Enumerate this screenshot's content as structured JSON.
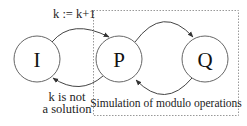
{
  "diagram": {
    "type": "state-diagram",
    "nodes": [
      {
        "id": "I",
        "label": "I",
        "cx": 37,
        "cy": 59,
        "r": 23
      },
      {
        "id": "P",
        "label": "P",
        "cx": 119,
        "cy": 59,
        "r": 23
      },
      {
        "id": "Q",
        "label": "Q",
        "cx": 205,
        "cy": 59,
        "r": 23
      }
    ],
    "edges": [
      {
        "from": "I",
        "to": "P",
        "label": "k := k+1"
      },
      {
        "from": "P",
        "to": "I",
        "label_lines": [
          "k is not",
          "a solution"
        ]
      },
      {
        "from": "P",
        "to": "Q",
        "label": ""
      },
      {
        "from": "Q",
        "to": "P",
        "label": ""
      }
    ],
    "group": {
      "label": "Simulation of modulo operations",
      "contains": [
        "P",
        "Q"
      ],
      "style": "dashed"
    },
    "colors": {
      "stroke": "#555555",
      "dashed_border": "#888888",
      "text": "#222222"
    }
  }
}
